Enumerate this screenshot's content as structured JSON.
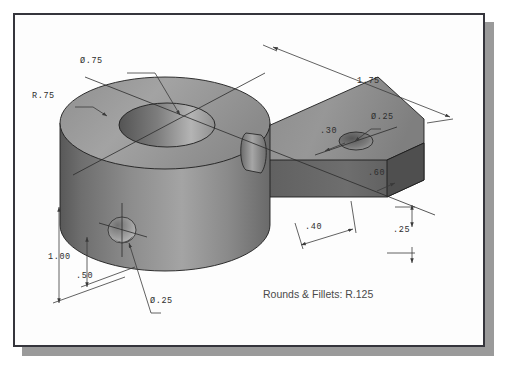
{
  "sheet": {
    "title": "engineering-part-drawing",
    "background_color": "#fdfdfd",
    "border_color": "#35353c",
    "shadow_color": "#9a9a9a"
  },
  "note": {
    "text": "Rounds & Fillets: R.125"
  },
  "dimensions": [
    {
      "id": "bore-diameter",
      "label": "Ø.75",
      "x": 78,
      "y": 60,
      "anchor": "start"
    },
    {
      "id": "boss-radius",
      "label": "R.75",
      "x": 30,
      "y": 95,
      "anchor": "start"
    },
    {
      "id": "overall-length",
      "label": "1.75",
      "x": 355,
      "y": 80,
      "anchor": "start"
    },
    {
      "id": "arm-hole-diameter",
      "label": "Ø.25",
      "x": 369,
      "y": 116,
      "anchor": "start"
    },
    {
      "id": "hole-offset-30",
      "label": ".30",
      "x": 318,
      "y": 130,
      "anchor": "start"
    },
    {
      "id": "arm-width-60",
      "label": ".60",
      "x": 366,
      "y": 172,
      "anchor": "start"
    },
    {
      "id": "arm-end-distance-40",
      "label": ".40",
      "x": 303,
      "y": 226,
      "anchor": "start"
    },
    {
      "id": "arm-thickness-25",
      "label": ".25",
      "x": 391,
      "y": 229,
      "anchor": "start"
    },
    {
      "id": "overall-height-100",
      "label": "1.00",
      "x": 46,
      "y": 256,
      "anchor": "start"
    },
    {
      "id": "hole-height-50",
      "label": ".50",
      "x": 74,
      "y": 275,
      "anchor": "start"
    },
    {
      "id": "side-hole-diameter",
      "label": "Ø.25",
      "x": 148,
      "y": 300,
      "anchor": "start"
    }
  ],
  "part": {
    "name": "cylindrical-boss-with-arm",
    "features": [
      "cylindrical boss",
      "through bore",
      "rectangular arm",
      "arm through hole",
      "side hole",
      "fillet"
    ]
  },
  "colors": {
    "surface_light": "#b9b9b9",
    "surface_mid": "#9c9c9c",
    "surface_dark": "#6f6f6f",
    "surface_darkest": "#4e4e4e",
    "line": "#1d1d1d"
  }
}
